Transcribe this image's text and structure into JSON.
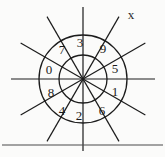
{
  "figure": {
    "type": "spoked-annulus-diagram",
    "axis_label": "x",
    "background_color": "#fbfbfa",
    "ink_color": "#1c1c1c",
    "center": {
      "x": 83,
      "y": 79
    },
    "radii": {
      "inner": 24,
      "outer": 44,
      "spoke_extent": 72
    },
    "spoke_count": 6,
    "sector_count": 12,
    "sectors": [
      {
        "index": 0,
        "label": "3",
        "angle_deg": -75,
        "label_x": 80,
        "label_y": 42
      },
      {
        "index": 1,
        "label": "9",
        "angle_deg": -45,
        "label_x": 103,
        "label_y": 48
      },
      {
        "index": 2,
        "label": "5",
        "angle_deg": -15,
        "label_x": 115,
        "label_y": 68
      },
      {
        "index": 3,
        "label": "1",
        "angle_deg": 15,
        "label_x": 115,
        "label_y": 91
      },
      {
        "index": 4,
        "label": "6",
        "angle_deg": 45,
        "label_x": 102,
        "label_y": 110
      },
      {
        "index": 5,
        "label": "2",
        "angle_deg": 75,
        "label_x": 79,
        "label_y": 115
      },
      {
        "index": 6,
        "label": "4",
        "angle_deg": 105,
        "label_x": 62,
        "label_y": 110
      },
      {
        "index": 7,
        "label": "8",
        "angle_deg": 135,
        "label_x": 51,
        "label_y": 92
      },
      {
        "index": 8,
        "label": "0",
        "angle_deg": 165,
        "label_x": 49,
        "label_y": 69
      },
      {
        "index": 9,
        "label": "7",
        "angle_deg": -165,
        "label_x": 62,
        "label_y": 49
      }
    ],
    "spokes": [
      {
        "index": 0,
        "angle_deg": 0,
        "name": "horizontal-spoke"
      },
      {
        "index": 1,
        "angle_deg": 30,
        "name": "spoke-30"
      },
      {
        "index": 2,
        "angle_deg": 60,
        "name": "spoke-60"
      },
      {
        "index": 3,
        "angle_deg": 90,
        "name": "vertical-spoke"
      },
      {
        "index": 4,
        "angle_deg": 120,
        "name": "spoke-120"
      },
      {
        "index": 5,
        "angle_deg": 150,
        "name": "spoke-150"
      }
    ],
    "axis_label_pos": {
      "x": 131,
      "y": 14
    },
    "baseline": {
      "x1": 2,
      "y1": 145,
      "x2": 163,
      "y2": 145
    }
  }
}
